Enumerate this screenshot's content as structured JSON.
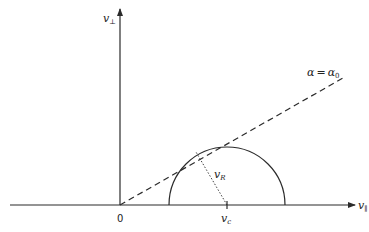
{
  "diagram": {
    "type": "velocity-space loss-cone sketch",
    "axes": {
      "horizontal_label": "v",
      "horizontal_subscript": "∥",
      "vertical_label": "v",
      "vertical_subscript": "⊥",
      "origin_label": "0"
    },
    "dashed_line_label": {
      "left": "α",
      "eq": "=",
      "right": "α",
      "right_subscript": "0"
    },
    "circle": {
      "center_label": "v",
      "center_subscript": "c",
      "radius_label": "v",
      "radius_subscript": "R"
    },
    "colors": {
      "stroke": "#2b2b2b",
      "background": "#ffffff"
    }
  }
}
